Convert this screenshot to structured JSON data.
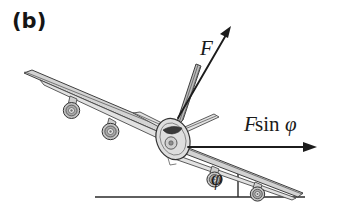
{
  "figure": {
    "panel_label": "(b)",
    "background_color": "#ffffff"
  },
  "labels": {
    "force_vector": "F",
    "horizontal_component_italic_f": "F",
    "horizontal_component_sin": "sin",
    "horizontal_component_phi": "φ",
    "bank_angle": "φ"
  },
  "annotations": {
    "force_arrow_name": "lift-force-arrow",
    "component_arrow_name": "horizontal-force-component-arrow",
    "ground_line_name": "horizontal-reference-line",
    "vertical_line_name": "vertical-reference-line",
    "angle_name": "bank-angle-marker"
  },
  "colors": {
    "ink": "#1c1c1c",
    "aircraft_outline": "#3a3a3a",
    "aircraft_fill": "#d3d3d3",
    "fin_fill": "#bcbcbc",
    "cockpit": "#3a3a3a",
    "rule": "#2a2a2a"
  },
  "geometry": {
    "bank_angle_degrees": 22,
    "force_arrow_from": [
      178,
      118
    ],
    "force_arrow_to": [
      231,
      26
    ],
    "component_arrow_from": [
      188,
      147
    ],
    "component_arrow_to": [
      316,
      147
    ],
    "ground_line_from": [
      95,
      197
    ],
    "ground_line_to": [
      305,
      197
    ],
    "vertical_line_from": [
      238,
      170
    ],
    "vertical_line_to": [
      238,
      197
    ]
  },
  "aircraft": {
    "engines_left_wing": 2,
    "engines_right_wing": 2,
    "view": "front-three-quarter"
  }
}
